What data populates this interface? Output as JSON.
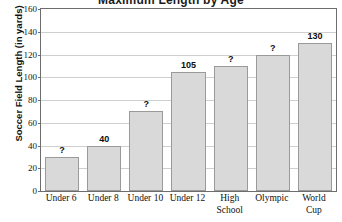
{
  "chart_data": {
    "type": "bar",
    "title": "Maximum Length by Age",
    "xlabel": "",
    "ylabel": "Soccer Field Length (in yards)",
    "categories": [
      "Under 6",
      "Under 8",
      "Under 10",
      "Under 12",
      "High School",
      "Olympic",
      "World Cup"
    ],
    "category_lines": [
      [
        "Under 6"
      ],
      [
        "Under 8"
      ],
      [
        "Under 10"
      ],
      [
        "Under 12"
      ],
      [
        "High",
        "School"
      ],
      [
        "Olympic"
      ],
      [
        "World",
        "Cup"
      ]
    ],
    "values": [
      30,
      40,
      70,
      105,
      110,
      120,
      130
    ],
    "data_labels": [
      "?",
      "40",
      "?",
      "105",
      "?",
      "?",
      "130"
    ],
    "ylim": [
      0,
      160
    ],
    "ytick_labels": [
      "0",
      "20",
      "40",
      "60",
      "80",
      "100",
      "120",
      "140",
      "160"
    ],
    "ytick_values": [
      0,
      20,
      40,
      60,
      80,
      100,
      120,
      140,
      160
    ],
    "grid": true,
    "legend": "none",
    "bar_fill_color": "#d9d9d9",
    "bar_border_color": "#9a9a9a",
    "grid_color": "#cfcfcf",
    "axis_color": "#6d6d6d"
  }
}
